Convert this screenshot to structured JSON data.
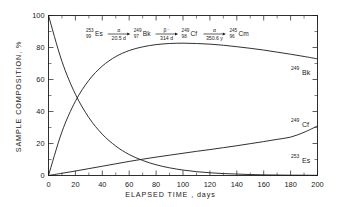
{
  "chart_data": {
    "type": "line",
    "title": "",
    "xlabel": "ELAPSED TIME , days",
    "ylabel": "SAMPLE COMPOSITION, %",
    "xlim": [
      0,
      200
    ],
    "ylim": [
      0,
      100
    ],
    "xticks": [
      0,
      20,
      40,
      60,
      80,
      100,
      120,
      140,
      160,
      180,
      200
    ],
    "yticks": [
      0,
      20,
      40,
      60,
      80,
      100
    ],
    "xtick_labels": [
      "0",
      "20",
      "40",
      "60",
      "80",
      "100",
      "120",
      "140",
      "160",
      "180",
      "200"
    ],
    "ytick_labels": [
      "0",
      "20",
      "40",
      "60",
      "80",
      "100"
    ],
    "minor_tick_interval_x": 10,
    "minor_tick_interval_y": 10,
    "grid": false,
    "legend": "inline-right-labels",
    "x": [
      0,
      10,
      20,
      30,
      40,
      50,
      60,
      70,
      80,
      90,
      100,
      110,
      120,
      130,
      140,
      150,
      160,
      170,
      180,
      190,
      200
    ],
    "series": [
      {
        "name": "253Es",
        "label_sup": "253",
        "label_base": "Es",
        "values": [
          100,
          71.3,
          50.8,
          36.2,
          25.8,
          18.4,
          13.1,
          9.4,
          6.7,
          4.8,
          3.4,
          2.4,
          1.7,
          1.2,
          0.9,
          0.6,
          0.4,
          0.3,
          0.2,
          0.2,
          0.1
        ]
      },
      {
        "name": "249Bk",
        "label_sup": "249",
        "label_base": "Bk",
        "values": [
          0,
          27.3,
          46.4,
          59.5,
          68.4,
          74.3,
          78.1,
          80.4,
          81.8,
          82.5,
          82.7,
          82.5,
          82.1,
          81.4,
          80.5,
          79.5,
          78.4,
          77.1,
          75.8,
          74.4,
          72.9
        ]
      },
      {
        "name": "249Cf",
        "label_sup": "249",
        "label_base": "Cf",
        "values": [
          0,
          1.4,
          2.8,
          4.3,
          5.8,
          7.3,
          8.8,
          10.2,
          11.5,
          12.7,
          13.9,
          15.1,
          16.2,
          17.4,
          18.6,
          19.9,
          21.2,
          22.6,
          24.0,
          27.0,
          31.0
        ]
      }
    ],
    "annotations": {
      "decay_chain": [
        {
          "mass": "253",
          "atomic": "99",
          "element": "Es"
        },
        {
          "mode": "α",
          "half_life": "20.5 d"
        },
        {
          "mass": "249",
          "atomic": "97",
          "element": "Bk"
        },
        {
          "mode": "β⁻",
          "half_life": "314 d"
        },
        {
          "mass": "249",
          "atomic": "98",
          "element": "Cf"
        },
        {
          "mode": "α",
          "half_life": "350.6 y"
        },
        {
          "mass": "245",
          "atomic": "96",
          "element": "Cm"
        }
      ]
    },
    "colors": {
      "axis": "#1a1a1a",
      "curve": "#1a1a1a",
      "background": "#ffffff"
    }
  }
}
